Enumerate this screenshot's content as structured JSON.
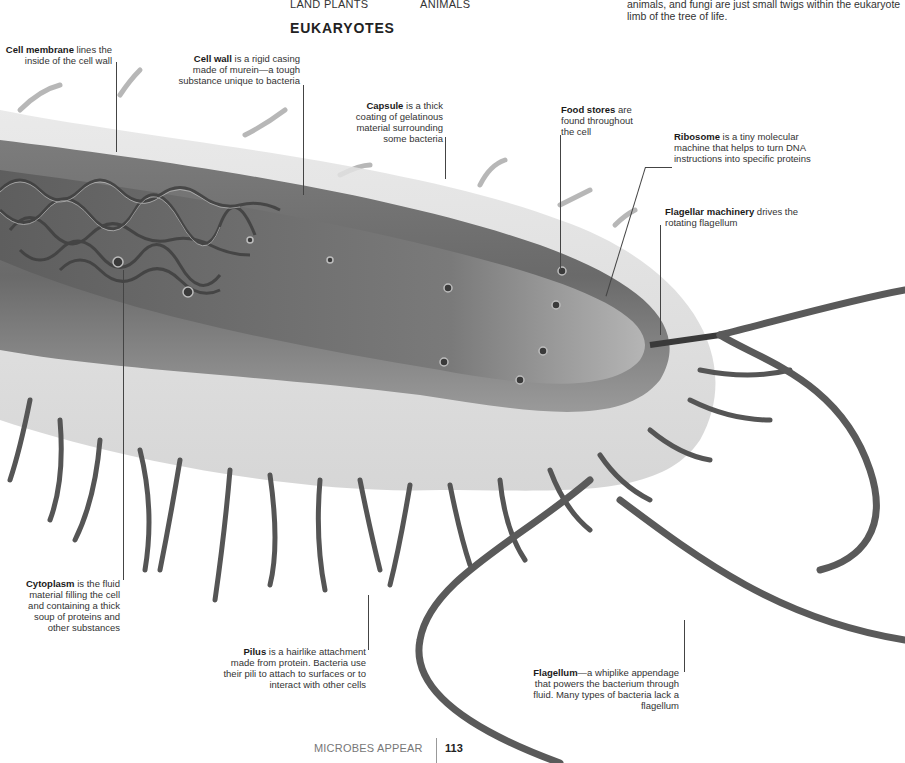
{
  "tree_of_life": {
    "branch_labels": [
      "LAND PLANTS",
      "ANIMALS"
    ],
    "heading": "EUKARYOTES",
    "intro_text_fragment": "19), but most branches are also microbes. The plants, animals, and fungi are just small twigs within the eukaryote limb of the tree of life."
  },
  "illustration": {
    "subject": "bacterium-cutaway",
    "colors": {
      "capsule": "#d9d9d9",
      "cell_body": "#6f6f6f",
      "interior": "#8a8a8a",
      "dna": "#4a4a4a",
      "flagella": "#5a5a5a",
      "background": "#ffffff"
    }
  },
  "callouts": {
    "cell_membrane": {
      "term": "Cell membrane",
      "text": " lines the inside of the cell wall"
    },
    "cell_wall": {
      "term": "Cell wall",
      "text": " is a rigid casing made of murein—a tough substance unique to bacteria"
    },
    "capsule": {
      "term": "Capsule",
      "text": " is a thick coating of gelatinous material surrounding some bacteria"
    },
    "food_stores": {
      "term": "Food stores",
      "text": " are found throughout the cell"
    },
    "ribosome": {
      "term": "Ribosome",
      "text": " is a tiny molecular machine that helps to turn DNA instructions into specific proteins"
    },
    "flagellar_machinery": {
      "term": "Flagellar machinery",
      "text": " drives the rotating flagellum"
    },
    "cytoplasm": {
      "term": "Cytoplasm",
      "text": " is the fluid material filling the cell and containing a thick soup of proteins and other substances"
    },
    "pilus": {
      "term": "Pilus",
      "text": " is a hairlike attachment made from protein. Bacteria use their pili to attach to surfaces or to interact with other cells"
    },
    "flagellum": {
      "term": "Flagellum",
      "text": "—a whiplike appendage that powers the bacterium through fluid. Many types of bacteria lack a flagellum"
    }
  },
  "footer": {
    "section": "MICROBES APPEAR",
    "page_number": "113"
  }
}
